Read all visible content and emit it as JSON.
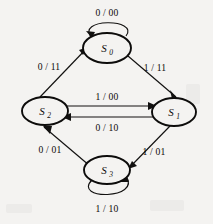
{
  "diagram": {
    "background_color": "#f4f3f1",
    "ink_color": "#121110",
    "nodes": [
      {
        "id": "S0",
        "label": "S",
        "subscript": "0",
        "cx": 107,
        "cy": 48,
        "rx": 24,
        "ry": 15
      },
      {
        "id": "S1",
        "label": "S",
        "subscript": "1",
        "cx": 174,
        "cy": 112,
        "rx": 22,
        "ry": 14
      },
      {
        "id": "S2",
        "label": "S",
        "subscript": "2",
        "cx": 45,
        "cy": 111,
        "rx": 23,
        "ry": 14
      },
      {
        "id": "S3",
        "label": "S",
        "subscript": "3",
        "cx": 107,
        "cy": 170,
        "rx": 23,
        "ry": 14
      }
    ],
    "edges": [
      {
        "id": "e-s0-s0",
        "from": "S0",
        "to": "S0",
        "label": "0 / 00",
        "label_x": 107,
        "label_y": 16,
        "kind": "self-loop-top"
      },
      {
        "id": "e-s0-s1",
        "from": "S0",
        "to": "S1",
        "label": "1 / 11",
        "label_x": 155,
        "label_y": 71,
        "kind": "diagonal"
      },
      {
        "id": "e-s2-s0",
        "from": "S2",
        "to": "S0",
        "label": "0 / 11",
        "label_x": 49,
        "label_y": 70,
        "kind": "diagonal"
      },
      {
        "id": "e-s2-s1",
        "from": "S2",
        "to": "S1",
        "label": "1 / 00",
        "label_x": 107,
        "label_y": 100,
        "kind": "horizontal-upper"
      },
      {
        "id": "e-s1-s2",
        "from": "S1",
        "to": "S2",
        "label": "0 / 10",
        "label_x": 107,
        "label_y": 130,
        "kind": "horizontal-lower"
      },
      {
        "id": "e-s1-s3",
        "from": "S1",
        "to": "S3",
        "label": "1 / 01",
        "label_x": 154,
        "label_y": 155,
        "kind": "diagonal"
      },
      {
        "id": "e-s3-s2",
        "from": "S3",
        "to": "S2",
        "label": "0 / 01",
        "label_x": 50,
        "label_y": 153,
        "kind": "diagonal"
      },
      {
        "id": "e-s3-s3",
        "from": "S3",
        "to": "S3",
        "label": "1 / 10",
        "label_x": 107,
        "label_y": 211,
        "kind": "self-loop-bottom"
      }
    ]
  }
}
